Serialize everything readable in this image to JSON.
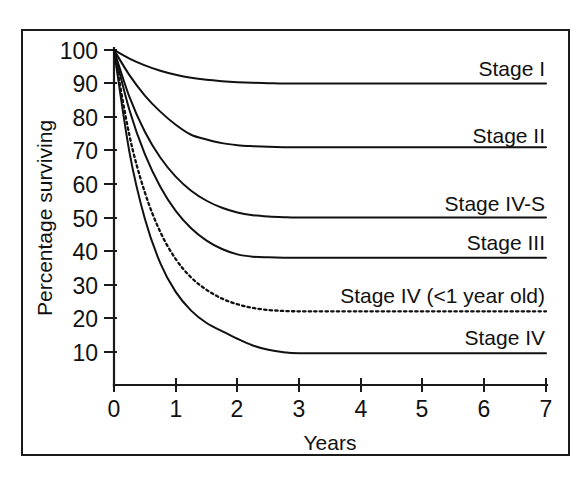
{
  "chart_data": {
    "type": "line",
    "title": "",
    "xlabel": "Years",
    "ylabel": "Percentage surviving",
    "xlim": [
      0,
      7
    ],
    "ylim": [
      0,
      100
    ],
    "grid": false,
    "legend_position": "inline-right",
    "xticks": [
      "0",
      "1",
      "2",
      "3",
      "4",
      "5",
      "6",
      "7"
    ],
    "xtick_values": [
      0,
      1,
      2,
      3,
      4,
      5,
      6,
      7
    ],
    "yticks": [
      "10",
      "20",
      "30",
      "40",
      "50",
      "60",
      "70",
      "80",
      "90",
      "100"
    ],
    "ytick_values": [
      10,
      20,
      30,
      40,
      50,
      60,
      70,
      80,
      90,
      100
    ],
    "x": [
      0,
      0.25,
      0.5,
      0.75,
      1,
      1.25,
      1.5,
      1.75,
      2,
      2.25,
      2.5,
      2.75,
      3,
      4,
      5,
      6,
      7
    ],
    "series": [
      {
        "name": "Stage I",
        "label": "Stage I",
        "style": "solid",
        "plateau": 90,
        "values": [
          100,
          97.4,
          95.4,
          93.8,
          92.6,
          91.7,
          91.1,
          90.7,
          90.4,
          90.2,
          90.1,
          90.0,
          90,
          90,
          90,
          90,
          90
        ]
      },
      {
        "name": "Stage II",
        "label": "Stage II",
        "style": "solid",
        "plateau": 71,
        "values": [
          100,
          92.5,
          86.4,
          81.6,
          77.7,
          74.7,
          73.3,
          72.2,
          71.6,
          71.3,
          71.1,
          71.0,
          71,
          71,
          71,
          71,
          71
        ]
      },
      {
        "name": "Stage IV-S",
        "label": "Stage IV-S",
        "style": "solid",
        "plateau": 50,
        "values": [
          100,
          86.0,
          75.6,
          67.9,
          62.2,
          58.0,
          55.0,
          52.9,
          51.5,
          50.7,
          50.3,
          50.1,
          50,
          50,
          50,
          50,
          50
        ]
      },
      {
        "name": "Stage III",
        "label": "Stage III",
        "style": "solid",
        "plateau": 38,
        "values": [
          100,
          82.1,
          68.9,
          59.2,
          52.0,
          46.8,
          43.1,
          40.6,
          39.0,
          38.3,
          38.1,
          38.0,
          38,
          38,
          38,
          38,
          38
        ]
      },
      {
        "name": "Stage IV (<1 year old)",
        "label": "Stage IV (<1 year old)",
        "style": "dotted",
        "plateau": 22,
        "values": [
          100,
          74.5,
          57.5,
          45.7,
          37.6,
          32.1,
          28.4,
          25.8,
          24.1,
          23.0,
          22.4,
          22.1,
          22,
          22,
          22,
          22,
          22
        ]
      },
      {
        "name": "Stage IV",
        "label": "Stage IV",
        "style": "solid",
        "plateau": 9.5,
        "values": [
          100,
          69.5,
          49.6,
          36.4,
          27.8,
          22.2,
          18.5,
          16.1,
          13.8,
          11.8,
          10.5,
          9.8,
          9.5,
          9.5,
          9.5,
          9.5,
          9.5
        ]
      }
    ],
    "colors": {
      "line": "#111111",
      "axis": "#1a1a1a",
      "frame": "#1a1a1a",
      "background": "#ffffff"
    }
  }
}
